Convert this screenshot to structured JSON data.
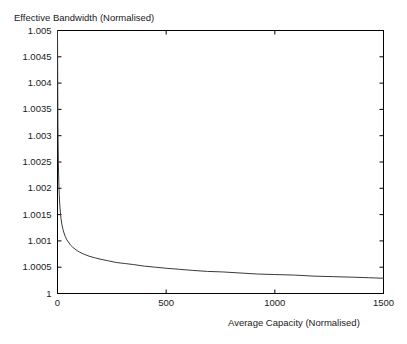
{
  "chart_data": {
    "type": "line",
    "title": "",
    "ylabel": "Effective Bandwidth (Normalised)",
    "xlabel": "Average Capacity (Normalised)",
    "xlim": [
      0,
      1500
    ],
    "ylim": [
      1,
      1.005
    ],
    "grid": false,
    "legend": null,
    "xticks": [
      0,
      500,
      1000,
      1500
    ],
    "xtick_labels": [
      "0",
      "500",
      "1000",
      "1500"
    ],
    "yticks": [
      1,
      1.0005,
      1.001,
      1.0015,
      1.002,
      1.0025,
      1.003,
      1.0035,
      1.004,
      1.0045,
      1.005
    ],
    "ytick_labels": [
      "1",
      "1.0005",
      "1.001",
      "1.0015",
      "1.002",
      "1.0025",
      "1.003",
      "1.0035",
      "1.004",
      "1.0045",
      "1.005"
    ],
    "line_color": "#3a3a3a",
    "axis_color": "#000000",
    "series": [
      {
        "name": "effective-bandwidth",
        "x": [
          0,
          2,
          4,
          6,
          8,
          10,
          13,
          16,
          20,
          25,
          30,
          36,
          43,
          50,
          60,
          70,
          85,
          100,
          120,
          145,
          170,
          200,
          235,
          270,
          310,
          350,
          400,
          450,
          500,
          560,
          620,
          690,
          760,
          840,
          920,
          1000,
          1090,
          1180,
          1270,
          1360,
          1430,
          1500
        ],
        "y": [
          1.005,
          1.00318,
          1.00248,
          1.00211,
          1.00188,
          1.00172,
          1.00155,
          1.00143,
          1.00132,
          1.00122,
          1.00115,
          1.00108,
          1.00102,
          1.00098,
          1.00092,
          1.00088,
          1.00083,
          1.00079,
          1.00075,
          1.00071,
          1.00068,
          1.00065,
          1.00062,
          1.00059,
          1.00057,
          1.00055,
          1.00052,
          1.0005,
          1.00048,
          1.00046,
          1.00044,
          1.00042,
          1.00041,
          1.00039,
          1.00037,
          1.00036,
          1.00035,
          1.00033,
          1.00032,
          1.00031,
          1.0003,
          1.00029
        ]
      }
    ]
  }
}
